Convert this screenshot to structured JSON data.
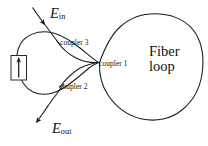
{
  "figure": {
    "background_color": "#ffffff",
    "line_color": "#1a1a1a",
    "labels": {
      "input_symbol": "E",
      "input_subscript": "in",
      "output_symbol": "E",
      "output_subscript": "out",
      "coupler1": "coupler 1",
      "coupler2": "coupler 2",
      "coupler3": "coupler 3",
      "fiber_loop_line1": "Fiber",
      "fiber_loop_line2": "loop"
    },
    "components": {
      "modulator_box": "rectangular-element",
      "modulator_arrow": "upward-arrow",
      "left_loop": "small-fiber-loop",
      "right_loop": "large-fiber-loop",
      "input_arrow": "input-beam-arrow",
      "output_arrow": "output-beam-arrow"
    }
  }
}
